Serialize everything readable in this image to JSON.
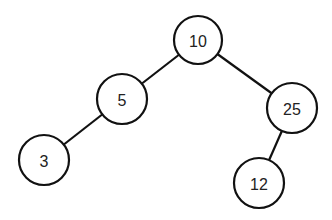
{
  "diagram": {
    "type": "binary-tree",
    "colors": {
      "stroke": "#111111",
      "fill": "#ffffff",
      "text": "#222222"
    },
    "nodes": [
      {
        "id": "n10",
        "label": "10",
        "x": 198,
        "y": 40,
        "r": 24
      },
      {
        "id": "n5",
        "label": "5",
        "x": 122,
        "y": 99,
        "r": 25
      },
      {
        "id": "n3",
        "label": "3",
        "x": 44,
        "y": 160,
        "r": 25
      },
      {
        "id": "n25",
        "label": "25",
        "x": 292,
        "y": 108,
        "r": 25
      },
      {
        "id": "n12",
        "label": "12",
        "x": 259,
        "y": 183,
        "r": 25
      }
    ],
    "edges": [
      {
        "from": "n10",
        "to": "n5"
      },
      {
        "from": "n5",
        "to": "n3"
      },
      {
        "from": "n10",
        "to": "n25"
      },
      {
        "from": "n25",
        "to": "n12"
      }
    ]
  }
}
